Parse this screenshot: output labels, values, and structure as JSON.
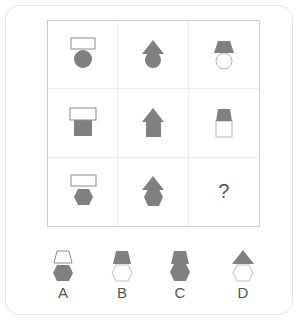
{
  "puzzle": {
    "colors": {
      "fill": "#808080",
      "stroke": "#8c8c8c",
      "outline": "#c0c0c0",
      "white": "#ffffff"
    },
    "grid": [
      [
        {
          "top": "rectangle-outline",
          "bottom": "circle-filled"
        },
        {
          "top": "triangle-filled",
          "bottom": "circle-filled"
        },
        {
          "top": "trapezoid-filled",
          "bottom": "circle-outline"
        }
      ],
      [
        {
          "top": "rectangle-outline",
          "bottom": "square-filled"
        },
        {
          "top": "triangle-filled",
          "bottom": "square-filled"
        },
        {
          "top": "trapezoid-filled",
          "bottom": "square-outline"
        }
      ],
      [
        {
          "top": "rectangle-outline",
          "bottom": "hexagon-filled"
        },
        {
          "top": "triangle-filled",
          "bottom": "hexagon-filled"
        },
        {
          "missing": true,
          "label": "?"
        }
      ]
    ],
    "question_mark": "?",
    "options": [
      {
        "label": "A",
        "top": "trapezoid-outline",
        "bottom": "hexagon-filled"
      },
      {
        "label": "B",
        "top": "trapezoid-filled",
        "bottom": "hexagon-outline"
      },
      {
        "label": "C",
        "top": "trapezoid-filled",
        "bottom": "hexagon-filled"
      },
      {
        "label": "D",
        "top": "triangle-filled",
        "bottom": "hexagon-outline"
      }
    ]
  }
}
